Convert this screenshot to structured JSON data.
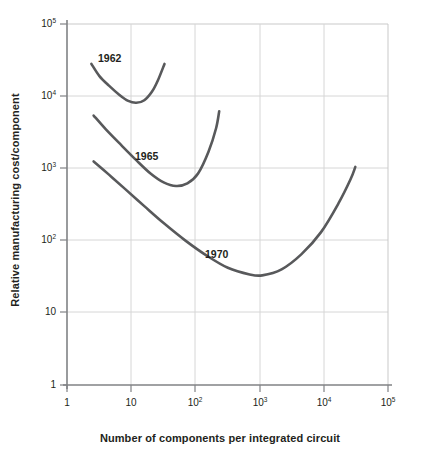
{
  "chart_data": {
    "type": "line",
    "title": "",
    "xlabel": "Number of components per integrated circuit",
    "ylabel": "Relative manufacturing cost/component",
    "xscale": "log",
    "yscale": "log",
    "xlim": [
      1,
      100000
    ],
    "ylim": [
      1,
      100000
    ],
    "grid": true,
    "legend": "inline-curve-labels",
    "xticks": [
      {
        "value": 1,
        "label": "1",
        "mantissa": "1",
        "exponent": ""
      },
      {
        "value": 10,
        "label": "10",
        "mantissa": "10",
        "exponent": ""
      },
      {
        "value": 100,
        "label": "10^2",
        "mantissa": "10",
        "exponent": "2"
      },
      {
        "value": 1000,
        "label": "10^3",
        "mantissa": "10",
        "exponent": "3"
      },
      {
        "value": 10000,
        "label": "10^4",
        "mantissa": "10",
        "exponent": "4"
      },
      {
        "value": 100000,
        "label": "10^5",
        "mantissa": "10",
        "exponent": "5"
      }
    ],
    "yticks": [
      {
        "value": 1,
        "label": "1",
        "mantissa": "1",
        "exponent": ""
      },
      {
        "value": 10,
        "label": "10",
        "mantissa": "10",
        "exponent": ""
      },
      {
        "value": 100,
        "label": "10^2",
        "mantissa": "10",
        "exponent": "2"
      },
      {
        "value": 1000,
        "label": "10^3",
        "mantissa": "10",
        "exponent": "3"
      },
      {
        "value": 10000,
        "label": "10^4",
        "mantissa": "10",
        "exponent": "4"
      },
      {
        "value": 100000,
        "label": "10^5",
        "mantissa": "10",
        "exponent": "5"
      }
    ],
    "series": [
      {
        "name": "1962",
        "label": "1962",
        "color": "#58595b",
        "points": [
          {
            "x": 2.4,
            "y": 28000
          },
          {
            "x": 3.2,
            "y": 19000
          },
          {
            "x": 4.5,
            "y": 14000
          },
          {
            "x": 6.5,
            "y": 10500
          },
          {
            "x": 9.0,
            "y": 8600
          },
          {
            "x": 12.0,
            "y": 8100
          },
          {
            "x": 16.0,
            "y": 8800
          },
          {
            "x": 21.0,
            "y": 11500
          },
          {
            "x": 26.0,
            "y": 16500
          },
          {
            "x": 33.0,
            "y": 28000
          }
        ]
      },
      {
        "name": "1965",
        "label": "1965",
        "color": "#58595b",
        "points": [
          {
            "x": 2.6,
            "y": 5400
          },
          {
            "x": 4.0,
            "y": 3500
          },
          {
            "x": 7.0,
            "y": 2100
          },
          {
            "x": 12.0,
            "y": 1300
          },
          {
            "x": 20.0,
            "y": 850
          },
          {
            "x": 32.0,
            "y": 640
          },
          {
            "x": 50.0,
            "y": 570
          },
          {
            "x": 75.0,
            "y": 620
          },
          {
            "x": 110.0,
            "y": 850
          },
          {
            "x": 160.0,
            "y": 1700
          },
          {
            "x": 210.0,
            "y": 3600
          },
          {
            "x": 235.0,
            "y": 6200
          }
        ]
      },
      {
        "name": "1970",
        "label": "1970",
        "color": "#58595b",
        "points": [
          {
            "x": 2.6,
            "y": 1250
          },
          {
            "x": 4.5,
            "y": 820
          },
          {
            "x": 8.0,
            "y": 520
          },
          {
            "x": 16.0,
            "y": 300
          },
          {
            "x": 32.0,
            "y": 175
          },
          {
            "x": 70.0,
            "y": 100
          },
          {
            "x": 150.0,
            "y": 62
          },
          {
            "x": 320.0,
            "y": 42
          },
          {
            "x": 700.0,
            "y": 34
          },
          {
            "x": 1100.0,
            "y": 33
          },
          {
            "x": 2200.0,
            "y": 40
          },
          {
            "x": 4500.0,
            "y": 65
          },
          {
            "x": 9000.0,
            "y": 130
          },
          {
            "x": 17000.0,
            "y": 330
          },
          {
            "x": 26000.0,
            "y": 700
          },
          {
            "x": 31000.0,
            "y": 1050
          }
        ]
      }
    ],
    "curve_labels": [
      {
        "text": "1962",
        "x_px": 98,
        "y_px": 52
      },
      {
        "text": "1965",
        "x_px": 135,
        "y_px": 150
      },
      {
        "text": "1970",
        "x_px": 205,
        "y_px": 248
      }
    ],
    "colors": {
      "curve": "#58595b",
      "axis": "#808285",
      "grid": "#d6d6d6",
      "text": "#231f20",
      "background": "#ffffff"
    }
  }
}
